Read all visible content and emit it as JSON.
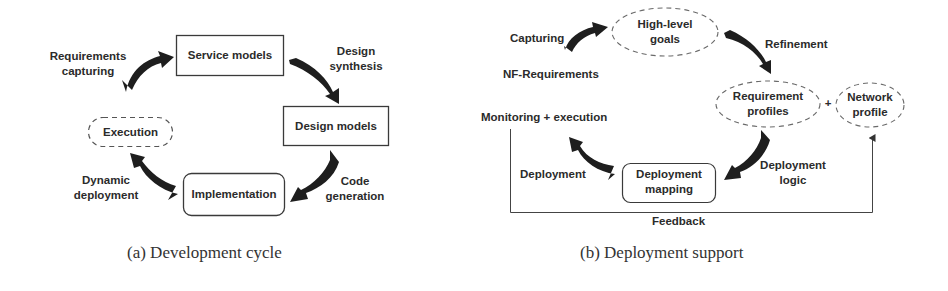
{
  "figure": {
    "panels": [
      {
        "id": "a",
        "caption": "(a) Development cycle",
        "nodes": [
          {
            "id": "service_models",
            "label": "Service models",
            "shape": "rectangle",
            "border": "solid"
          },
          {
            "id": "design_models",
            "label": "Design models",
            "shape": "rectangle",
            "border": "solid"
          },
          {
            "id": "implementation",
            "label": "Implementation",
            "shape": "rounded-rectangle",
            "border": "solid"
          },
          {
            "id": "execution",
            "label": "Execution",
            "shape": "pill",
            "border": "dashed"
          }
        ],
        "edges": [
          {
            "from": "execution",
            "to": "service_models",
            "label_line1": "Requirements",
            "label_line2": "capturing"
          },
          {
            "from": "service_models",
            "to": "design_models",
            "label_line1": "Design",
            "label_line2": "synthesis"
          },
          {
            "from": "design_models",
            "to": "implementation",
            "label_line1": "Code",
            "label_line2": "generation"
          },
          {
            "from": "implementation",
            "to": "execution",
            "label_line1": "Dynamic",
            "label_line2": "deployment"
          }
        ]
      },
      {
        "id": "b",
        "caption": "(b) Deployment support",
        "nodes": [
          {
            "id": "high_level_goals",
            "label_line1": "High-level",
            "label_line2": "goals",
            "shape": "ellipse",
            "border": "dashed"
          },
          {
            "id": "requirement_profiles",
            "label_line1": "Requirement",
            "label_line2": "profiles",
            "shape": "ellipse",
            "border": "dashed"
          },
          {
            "id": "network_profile",
            "label_line1": "Network",
            "label_line2": "profile",
            "shape": "ellipse",
            "border": "dashed"
          },
          {
            "id": "deployment_mapping",
            "label_line1": "Deployment",
            "label_line2": "mapping",
            "shape": "rounded-rectangle",
            "border": "solid"
          }
        ],
        "plus_sign": "+",
        "texts": {
          "nf_requirements": "NF-Requirements",
          "monitoring_execution": "Monitoring + execution"
        },
        "edges": [
          {
            "from": "nf_requirements",
            "to": "high_level_goals",
            "label": "Capturing"
          },
          {
            "from": "high_level_goals",
            "to": "requirement_profiles",
            "label": "Refinement"
          },
          {
            "from": "requirement_profiles",
            "to": "deployment_mapping",
            "label_line1": "Deployment",
            "label_line2": "logic"
          },
          {
            "from": "deployment_mapping",
            "to": "monitoring_execution",
            "label": "Deployment"
          },
          {
            "from": "monitoring_execution",
            "to": "network_profile",
            "label": "Feedback",
            "style": "thin-line"
          }
        ]
      }
    ],
    "colors": {
      "arrow_fill": "#1e1e1e",
      "box_stroke": "#3a3a3a",
      "dashed_stroke": "#6a6a6a",
      "text": "#2b2b2b",
      "background": "#ffffff"
    }
  }
}
